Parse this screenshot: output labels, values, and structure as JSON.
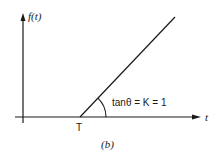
{
  "diagram": {
    "y_axis_label": "f(t)",
    "x_axis_label": "t",
    "point_label": "T",
    "slope_annotation": "tanθ = K = 1",
    "caption": "(b)",
    "colors": {
      "line": "#1a1a1a",
      "background": "#ffffff"
    }
  }
}
